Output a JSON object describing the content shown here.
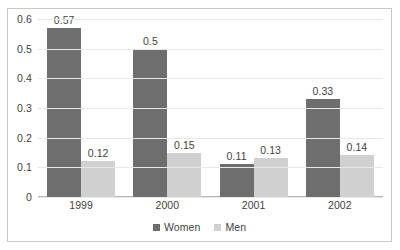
{
  "chart_data": {
    "type": "bar",
    "title": "",
    "xlabel": "",
    "ylabel": "",
    "categories": [
      "1999",
      "2000",
      "2001",
      "2002"
    ],
    "series": [
      {
        "name": "Women",
        "color": "#6e6e6e",
        "values": [
          0.57,
          0.5,
          0.11,
          0.33
        ],
        "labels": [
          "0.57",
          "0.5",
          "0.11",
          "0.33"
        ]
      },
      {
        "name": "Men",
        "color": "#d0d0d0",
        "values": [
          0.12,
          0.15,
          0.13,
          0.14
        ],
        "labels": [
          "0.12",
          "0.15",
          "0.13",
          "0.14"
        ]
      }
    ],
    "ylim": [
      0,
      0.6
    ],
    "ytick_labels": [
      "0.6",
      "0.5",
      "0.4",
      "0.3",
      "0.2",
      "0.1",
      "0"
    ],
    "ytick_values": [
      0.6,
      0.5,
      0.4,
      0.3,
      0.2,
      0.1,
      0
    ],
    "grid": true,
    "legend_position": "bottom"
  },
  "legend": {
    "items": [
      {
        "label": "Women",
        "color": "#6e6e6e"
      },
      {
        "label": "Men",
        "color": "#d0d0d0"
      }
    ]
  },
  "colors": {
    "women": "#6e6e6e",
    "men": "#d0d0d0",
    "gridline": "#e8e8e8",
    "border": "#c8c8c8",
    "text": "#3f3f3f",
    "background": "#ffffff"
  }
}
